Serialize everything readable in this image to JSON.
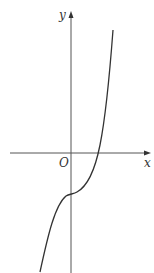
{
  "diagram": {
    "type": "function-graph",
    "axes": {
      "x_label": "x",
      "y_label": "y",
      "origin_label": "O"
    },
    "colors": {
      "axis": "#555555",
      "curve": "#333333",
      "text": "#333333"
    },
    "curve": {
      "x_intercept": "positive",
      "y_intercept": "negative",
      "shape": "increasing cubic with horizontal inflection on y-axis"
    }
  }
}
